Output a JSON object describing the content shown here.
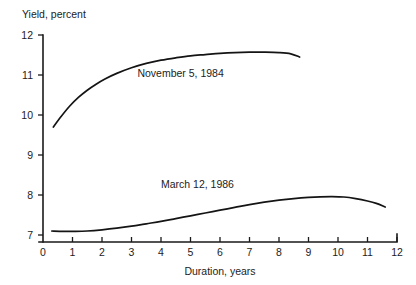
{
  "chart_data": {
    "type": "line",
    "title": "",
    "xlabel": "Duration, years",
    "ylabel": "Yield, percent",
    "xlim": [
      0,
      12
    ],
    "ylim": [
      7,
      12
    ],
    "xticks": [
      0,
      1,
      2,
      3,
      4,
      5,
      6,
      7,
      8,
      9,
      10,
      11,
      12
    ],
    "xtick_labels": [
      "0",
      "1",
      "2",
      "3",
      "4",
      "5",
      "6",
      "7",
      "8",
      "9",
      "10",
      "11",
      "12"
    ],
    "yticks": [
      7,
      8,
      9,
      10,
      11,
      12
    ],
    "ytick_labels": [
      "7",
      "8",
      "9",
      "10",
      "11",
      "12"
    ],
    "grid": false,
    "legend_position": "inline-annotation",
    "series": [
      {
        "name": "November 5, 1984",
        "label_x": 3.2,
        "label_y": 10.95,
        "x": [
          0.35,
          0.6,
          0.9,
          1.2,
          1.5,
          1.8,
          2.1,
          2.5,
          3.0,
          3.5,
          4.0,
          4.5,
          5.0,
          5.5,
          6.0,
          6.5,
          7.0,
          7.5,
          8.0,
          8.4,
          8.7
        ],
        "y": [
          9.7,
          9.95,
          10.22,
          10.44,
          10.62,
          10.77,
          10.9,
          11.04,
          11.18,
          11.29,
          11.37,
          11.43,
          11.48,
          11.51,
          11.54,
          11.56,
          11.57,
          11.57,
          11.56,
          11.53,
          11.45
        ]
      },
      {
        "name": "March 12, 1986",
        "label_x": 4.0,
        "label_y": 8.18,
        "x": [
          0.3,
          0.7,
          1.1,
          1.5,
          2.0,
          2.5,
          3.0,
          3.5,
          4.0,
          4.5,
          5.0,
          5.5,
          6.0,
          6.5,
          7.0,
          7.5,
          8.0,
          8.5,
          9.0,
          9.4,
          9.8,
          10.2,
          10.6,
          11.0,
          11.3,
          11.6
        ],
        "y": [
          7.1,
          7.09,
          7.09,
          7.1,
          7.13,
          7.17,
          7.22,
          7.28,
          7.34,
          7.41,
          7.48,
          7.55,
          7.62,
          7.69,
          7.76,
          7.82,
          7.87,
          7.91,
          7.94,
          7.955,
          7.96,
          7.95,
          7.91,
          7.85,
          7.79,
          7.7
        ]
      }
    ],
    "colors": {
      "line": "#141414",
      "axis": "#1a1a1a",
      "text": "#1c1c1c",
      "background": "#ffffff"
    }
  }
}
